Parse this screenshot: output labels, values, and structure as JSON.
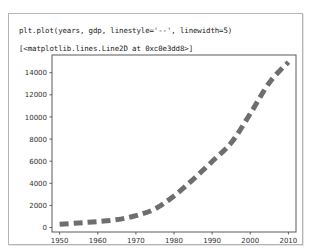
{
  "cell": {
    "input_code": "plt.plot(years, gdp, linestyle='--', linewidth=5)",
    "output_repr": "[<matplotlib.lines.Line2D at 0xc0e3dd8>]"
  },
  "chart_data": {
    "type": "line",
    "title": "",
    "xlabel": "",
    "ylabel": "",
    "xlim": [
      1948,
      2012
    ],
    "ylim": [
      -400,
      15600
    ],
    "xticks": [
      1950,
      1960,
      1970,
      1980,
      1990,
      2000,
      2010
    ],
    "yticks": [
      0,
      2000,
      4000,
      6000,
      8000,
      10000,
      12000,
      14000
    ],
    "grid": false,
    "legend": null,
    "series": [
      {
        "name": "gdp",
        "color": "#6e6e6e",
        "linestyle": "--",
        "linewidth": 5,
        "x": [
          1950,
          1955,
          1960,
          1965,
          1970,
          1975,
          1980,
          1985,
          1990,
          1995,
          2000,
          2005,
          2010
        ],
        "y": [
          300.2,
          420.0,
          543.3,
          719.1,
          1075.9,
          1688.9,
          2862.5,
          4346.7,
          5979.6,
          7664.0,
          10289.7,
          13095.4,
          14958.3
        ]
      }
    ]
  }
}
